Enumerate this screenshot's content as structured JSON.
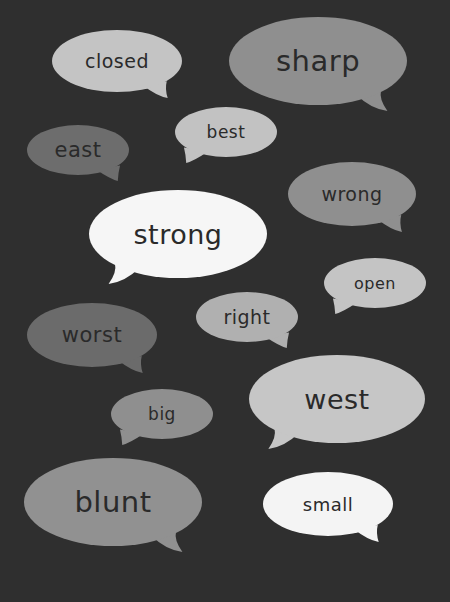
{
  "background": "#2f2f2f",
  "text_color": "#2a2a2a",
  "bubbles": [
    {
      "word": "closed",
      "cx": 117,
      "cy": 61,
      "rx": 65,
      "ry": 31,
      "fill": "#c4c4c4",
      "tail": "right",
      "font_size": 19
    },
    {
      "word": "sharp",
      "cx": 318,
      "cy": 61,
      "rx": 89,
      "ry": 44,
      "fill": "#8f8f8f",
      "tail": "right",
      "font_size": 29
    },
    {
      "word": "east",
      "cx": 78,
      "cy": 150,
      "rx": 51,
      "ry": 25,
      "fill": "#6d6d6d",
      "tail": "right",
      "font_size": 21
    },
    {
      "word": "best",
      "cx": 226,
      "cy": 132,
      "rx": 51,
      "ry": 25,
      "fill": "#c2c2c2",
      "tail": "left",
      "font_size": 17
    },
    {
      "word": "wrong",
      "cx": 352,
      "cy": 194,
      "rx": 64,
      "ry": 32,
      "fill": "#8f8f8f",
      "tail": "right",
      "font_size": 19
    },
    {
      "word": "strong",
      "cx": 178,
      "cy": 234,
      "rx": 89,
      "ry": 44,
      "fill": "#f6f6f6",
      "tail": "left",
      "font_size": 27
    },
    {
      "word": "open",
      "cx": 375,
      "cy": 283,
      "rx": 51,
      "ry": 25,
      "fill": "#c4c4c4",
      "tail": "left",
      "font_size": 16
    },
    {
      "word": "right",
      "cx": 247,
      "cy": 317,
      "rx": 51,
      "ry": 25,
      "fill": "#b0b0b0",
      "tail": "right",
      "font_size": 19
    },
    {
      "word": "worst",
      "cx": 92,
      "cy": 335,
      "rx": 65,
      "ry": 32,
      "fill": "#6b6b6b",
      "tail": "right",
      "font_size": 21
    },
    {
      "word": "west",
      "cx": 337,
      "cy": 399,
      "rx": 88,
      "ry": 44,
      "fill": "#c6c6c6",
      "tail": "left",
      "font_size": 27
    },
    {
      "word": "big",
      "cx": 162,
      "cy": 414,
      "rx": 51,
      "ry": 25,
      "fill": "#8f8f8f",
      "tail": "left",
      "font_size": 17
    },
    {
      "word": "blunt",
      "cx": 113,
      "cy": 502,
      "rx": 89,
      "ry": 44,
      "fill": "#919191",
      "tail": "right",
      "font_size": 29
    },
    {
      "word": "small",
      "cx": 328,
      "cy": 504,
      "rx": 65,
      "ry": 32,
      "fill": "#f4f4f4",
      "tail": "right",
      "font_size": 18
    }
  ]
}
